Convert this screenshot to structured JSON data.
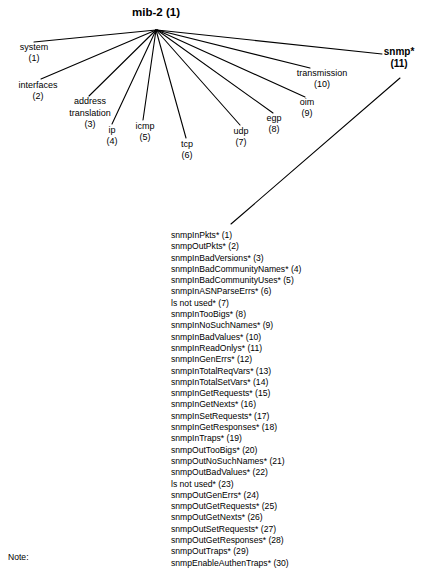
{
  "diagram": {
    "root": {
      "name": "mib-2",
      "oid": "(1)"
    },
    "children": [
      {
        "name": "system",
        "oid": "(1)",
        "bold": false
      },
      {
        "name": "interfaces",
        "oid": "(2)",
        "bold": false
      },
      {
        "name": "address translation",
        "name_line1": "address",
        "name_line2": "translation",
        "oid": "(3)",
        "bold": false
      },
      {
        "name": "ip",
        "oid": "(4)",
        "bold": false
      },
      {
        "name": "icmp",
        "oid": "(5)",
        "bold": false
      },
      {
        "name": "tcp",
        "oid": "(6)",
        "bold": false
      },
      {
        "name": "udp",
        "oid": "(7)",
        "bold": false
      },
      {
        "name": "egp",
        "oid": "(8)",
        "bold": false
      },
      {
        "name": "oim",
        "oid": "(9)",
        "bold": false
      },
      {
        "name": "transmission",
        "oid": "(10)",
        "bold": false
      },
      {
        "name": "snmp*",
        "oid": "(11)",
        "bold": true
      }
    ]
  },
  "snmp_variables": [
    "snmpInPkts* (1)",
    "snmpOutPkts* (2)",
    "snmpInBadVersions* (3)",
    "snmpInBadCommunityNames* (4)",
    "snmpInBadCommunityUses* (5)",
    "snmpInASNParseErrs* (6)",
    "ls not used* (7)",
    "snmpInTooBigs* (8)",
    "snmpInNoSuchNames* (9)",
    "snmpInBadValues* (10)",
    "snmpInReadOnlys* (11)",
    "snmpInGenErrs* (12)",
    "snmpInTotalReqVars* (13)",
    "snmpInTotalSetVars* (14)",
    "snmpInGetRequests* (15)",
    "snmpInGetNexts* (16)",
    "snmpInSetRequests* (17)",
    "snmpInGetResponses* (18)",
    "snmpInTraps* (19)",
    "snmpOutTooBigs* (20)",
    "snmpOutNoSuchNames* (21)",
    "snmpOutBadValues* (22)",
    "ls not used* (23)",
    "snmpOutGenErrs* (24)",
    "snmpOutGetRequests* (25)",
    "snmpOutGetNexts* (26)",
    "snmpOutSetRequests* (27)",
    "snmpOutGetResponses* (28)",
    "snmpOutTraps* (29)",
    "snmpEnableAuthenTraps* (30)"
  ],
  "note": {
    "label": "Note:"
  },
  "colors": {
    "background": "#ffffff",
    "ink": "#000000",
    "edge": "#000000"
  }
}
